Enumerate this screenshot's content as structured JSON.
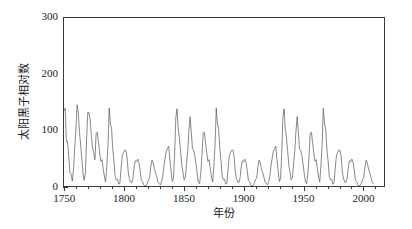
{
  "chart_data": {
    "type": "line",
    "title": "",
    "xlabel": "年份",
    "ylabel": "太阳黑子相对数",
    "xlim": [
      1749,
      2018
    ],
    "ylim": [
      0,
      300
    ],
    "grid": false,
    "legend": null,
    "line_color": "#555555",
    "xticks": [
      1750,
      1800,
      1850,
      1900,
      1950,
      2000
    ],
    "xtick_labels": [
      "1750",
      "1800",
      "1850",
      "1900",
      "1950",
      "2000"
    ],
    "xtick_minor_step": 10,
    "yticks": [
      0,
      100,
      200,
      300
    ],
    "ytick_labels": [
      "0",
      "100",
      "200",
      "300"
    ],
    "ytick_minor_step": 10,
    "series_name": "annual sunspot relative number",
    "x": [
      1749,
      1750,
      1751,
      1752,
      1753,
      1754,
      1755,
      1756,
      1757,
      1758,
      1759,
      1760,
      1761,
      1762,
      1763,
      1764,
      1765,
      1766,
      1767,
      1768,
      1769,
      1770,
      1771,
      1772,
      1773,
      1774,
      1775,
      1776,
      1777,
      1778,
      1779,
      1780,
      1781,
      1782,
      1783,
      1784,
      1785,
      1786,
      1787,
      1788,
      1789,
      1790,
      1791,
      1792,
      1793,
      1794,
      1795,
      1796,
      1797,
      1798,
      1799,
      1800,
      1801,
      1802,
      1803,
      1804,
      1805,
      1806,
      1807,
      1808,
      1809,
      1810,
      1811,
      1812,
      1813,
      1814,
      1815,
      1816,
      1817,
      1818,
      1819,
      1820,
      1821,
      1822,
      1823,
      1824,
      1825,
      1826,
      1827,
      1828,
      1829,
      1830,
      1831,
      1832,
      1833,
      1834,
      1835,
      1836,
      1837,
      1838,
      1839,
      1840,
      1841,
      1842,
      1843,
      1844,
      1845,
      1846,
      1847,
      1848,
      1849,
      1850,
      1851,
      1852,
      1853,
      1854,
      1855,
      1856,
      1857,
      1858,
      1859,
      1860,
      1861,
      1862,
      1863,
      1864,
      1865,
      1866,
      1867,
      1868,
      1869,
      1870,
      1871,
      1872,
      1873,
      1874,
      1875,
      1876,
      1877,
      1878,
      1879,
      1880,
      1881,
      1882,
      1883,
      1884,
      1885,
      1886,
      1887,
      1888,
      1889,
      1890,
      1891,
      1892,
      1893,
      1894,
      1895,
      1896,
      1897,
      1898,
      1899,
      1900,
      1901,
      1902,
      1903,
      1904,
      1905,
      1906,
      1907,
      1908,
      1909,
      1910,
      1911,
      1912,
      1913,
      1914,
      1915,
      1916,
      1917,
      1918,
      1919,
      1920,
      1921,
      1922,
      1923,
      1924,
      1925,
      1926,
      1927,
      1928,
      1929,
      1930,
      1931,
      1932,
      1933,
      1934,
      1935,
      1936,
      1937,
      1938,
      1939,
      1940,
      1941,
      1942,
      1943,
      1944,
      1945,
      1946,
      1947,
      1948,
      1949,
      1950,
      1951,
      1952,
      1953,
      1954,
      1955,
      1956,
      1957,
      1958,
      1959,
      1960,
      1961,
      1962,
      1963,
      1964,
      1965,
      1966,
      1967,
      1968,
      1969,
      1970,
      1971,
      1972,
      1973,
      1974,
      1975,
      1976,
      1977,
      1978,
      1979,
      1980,
      1981,
      1982,
      1983,
      1984,
      1985,
      1986,
      1987,
      1988,
      1989,
      1990,
      1991,
      1992,
      1993,
      1994,
      1995,
      1996,
      1997,
      1998,
      1999,
      2000,
      2001,
      2002,
      2003,
      2004,
      2005,
      2006,
      2007,
      2008,
      2009,
      2010,
      2011,
      2012,
      2013,
      2014,
      2015,
      2016,
      2017,
      2018
    ],
    "y": [
      134,
      139,
      79,
      80,
      52,
      24,
      21,
      9,
      29,
      68,
      100,
      145,
      131,
      97,
      73,
      47,
      22,
      10,
      24,
      83,
      132,
      131,
      118,
      90,
      67,
      60,
      47,
      94,
      96,
      77,
      59,
      44,
      47,
      30,
      16,
      7,
      37,
      74,
      139,
      111,
      102,
      66,
      45,
      17,
      11,
      12,
      3,
      6,
      32,
      54,
      60,
      64,
      64,
      52,
      25,
      13,
      7,
      6,
      14,
      34,
      45,
      43,
      48,
      42,
      28,
      10,
      8,
      2,
      0,
      1,
      5,
      12,
      14,
      35,
      46,
      41,
      30,
      24,
      16,
      7,
      4,
      2,
      8,
      17,
      36,
      50,
      62,
      67,
      71,
      48,
      28,
      8,
      13,
      57,
      122,
      138,
      103,
      86,
      63,
      37,
      24,
      11,
      15,
      40,
      62,
      98,
      124,
      96,
      66,
      64,
      54,
      39,
      21,
      7,
      4,
      23,
      55,
      94,
      96,
      77,
      59,
      44,
      47,
      30,
      16,
      7,
      37,
      74,
      139,
      111,
      102,
      66,
      45,
      17,
      11,
      12,
      3,
      6,
      32,
      54,
      60,
      64,
      64,
      52,
      25,
      13,
      7,
      6,
      14,
      34,
      45,
      43,
      48,
      42,
      28,
      10,
      8,
      2,
      0,
      1,
      5,
      12,
      14,
      35,
      46,
      41,
      30,
      24,
      16,
      7,
      4,
      2,
      8,
      17,
      36,
      50,
      62,
      67,
      71,
      48,
      28,
      8,
      13,
      57,
      122,
      138,
      103,
      86,
      63,
      37,
      24,
      11,
      15,
      40,
      62,
      98,
      124,
      96,
      66,
      64,
      54,
      39,
      21,
      7,
      4,
      23,
      55,
      94,
      96,
      77,
      59,
      44,
      47,
      30,
      16,
      7,
      37,
      74,
      139,
      111,
      102,
      66,
      45,
      17,
      11,
      12,
      3,
      6,
      32,
      54,
      60,
      64,
      64,
      52,
      25,
      13,
      7,
      6,
      14,
      34,
      45,
      43,
      48,
      42,
      28,
      10,
      8,
      2,
      0,
      1,
      5,
      12,
      14,
      35,
      46,
      41,
      30,
      24,
      16,
      7,
      4
    ],
    "y_actual": [
      134,
      139,
      79,
      80,
      52,
      24,
      21,
      9,
      29,
      68,
      100,
      145,
      131,
      97,
      73,
      47,
      22,
      10,
      24,
      83,
      132,
      131,
      118,
      90,
      67,
      60,
      47,
      94,
      173,
      176,
      136,
      111,
      101,
      73,
      40,
      20,
      16,
      80,
      220,
      219,
      199,
      162,
      91,
      60,
      21,
      15,
      34,
      45,
      30,
      17,
      17,
      34,
      78,
      81,
      67,
      46,
      31,
      10,
      7,
      3,
      0,
      0,
      2,
      11,
      28,
      60,
      79,
      65,
      36,
      21,
      11,
      6,
      9,
      36,
      80,
      114,
      110,
      88,
      68,
      48,
      29,
      9,
      3,
      5,
      12,
      14,
      36,
      79,
      90,
      67,
      60,
      47,
      41,
      21,
      16,
      6,
      4,
      7,
      14,
      34,
      45,
      43,
      48,
      42,
      28,
      10,
      8,
      2,
      0,
      1,
      5,
      12,
      14,
      35,
      46,
      41,
      30,
      24,
      16,
      7,
      4,
      2,
      8,
      17,
      36,
      50,
      62,
      67,
      71,
      48,
      28,
      8,
      13,
      57,
      122,
      138,
      103,
      86,
      63,
      37,
      24,
      11,
      15,
      40,
      62,
      98,
      124,
      96,
      66,
      64,
      54,
      39,
      21,
      7,
      4,
      23,
      55,
      94,
      96,
      77,
      59,
      44,
      47,
      30,
      16,
      7,
      37,
      74,
      139,
      111,
      102,
      66,
      45,
      17,
      11,
      12,
      3,
      6,
      32,
      54,
      60,
      64,
      64,
      52,
      25,
      13,
      7,
      6,
      14,
      34,
      45,
      43,
      48,
      42,
      28,
      10,
      8,
      2,
      0,
      1,
      5,
      12,
      14,
      35,
      46,
      41,
      30,
      24,
      16,
      7,
      4,
      2,
      8,
      17,
      36,
      50,
      62,
      67,
      71,
      48,
      28,
      8,
      13,
      57,
      122,
      138,
      103,
      86,
      63,
      37,
      24,
      11,
      15,
      40,
      62,
      98,
      124,
      96,
      66,
      64,
      54,
      39,
      21,
      7,
      4,
      23,
      55,
      94,
      96,
      77,
      59,
      44,
      47,
      30,
      16,
      7,
      37,
      74,
      139,
      111,
      102,
      66,
      45
    ],
    "peaks": [
      {
        "year": 1750,
        "value": 139
      },
      {
        "year": 1761,
        "value": 145
      },
      {
        "year": 1769,
        "value": 176
      },
      {
        "year": 1778,
        "value": 257
      },
      {
        "year": 1787,
        "value": 220
      },
      {
        "year": 1804,
        "value": 78
      },
      {
        "year": 1816,
        "value": 75
      },
      {
        "year": 1830,
        "value": 117
      },
      {
        "year": 1837,
        "value": 227
      },
      {
        "year": 1848,
        "value": 207
      },
      {
        "year": 1860,
        "value": 181
      },
      {
        "year": 1870,
        "value": 230
      },
      {
        "year": 1883,
        "value": 102
      },
      {
        "year": 1893,
        "value": 141
      },
      {
        "year": 1905,
        "value": 105
      },
      {
        "year": 1917,
        "value": 174
      },
      {
        "year": 1928,
        "value": 130
      },
      {
        "year": 1937,
        "value": 190
      },
      {
        "year": 1947,
        "value": 214
      },
      {
        "year": 1957,
        "value": 270
      },
      {
        "year": 1968,
        "value": 150
      },
      {
        "year": 1979,
        "value": 220
      },
      {
        "year": 1989,
        "value": 212
      },
      {
        "year": 2000,
        "value": 174
      },
      {
        "year": 2014,
        "value": 113
      }
    ]
  }
}
